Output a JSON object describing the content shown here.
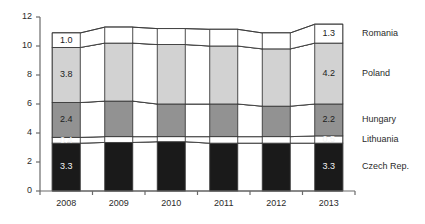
{
  "chart_data": {
    "type": "bar",
    "subtype": "stacked-bar-with-bands",
    "title": "",
    "subtitle": "",
    "xlabel": "",
    "ylabel": "",
    "categories": [
      "2008",
      "2009",
      "2010",
      "2011",
      "2012",
      "2013"
    ],
    "ylim": [
      0,
      12
    ],
    "yticks": [
      0,
      2,
      4,
      6,
      8,
      10,
      12
    ],
    "ytick_labels": [
      "0",
      "2",
      "4",
      "6",
      "8",
      "10",
      "12"
    ],
    "grid": false,
    "legend_position": "right",
    "series": [
      {
        "name": "Czech Rep.",
        "color": "#1a1a1a",
        "label_color": "#f2f2f2",
        "values": [
          3.3,
          3.35,
          3.4,
          3.3,
          3.3,
          3.3
        ],
        "labels": [
          "3.3",
          "",
          "",
          "",
          "",
          "3.3"
        ]
      },
      {
        "name": "Lithuania",
        "color": "#ffffff",
        "label_color": "#f2f2f2",
        "values": [
          0.4,
          0.4,
          0.35,
          0.45,
          0.45,
          0.5
        ],
        "labels": [
          "0.4",
          "",
          "",
          "",
          "",
          "0.5"
        ]
      },
      {
        "name": "Hungary",
        "color": "#929292",
        "label_color": "#1c1c1c",
        "values": [
          2.4,
          2.45,
          2.25,
          2.25,
          2.1,
          2.2
        ],
        "labels": [
          "2.4",
          "",
          "",
          "",
          "",
          "2.2"
        ]
      },
      {
        "name": "Poland",
        "color": "#d2d2d2",
        "label_color": "#1c1c1c",
        "values": [
          3.8,
          4.0,
          4.1,
          4.0,
          3.95,
          4.2
        ],
        "labels": [
          "3.8",
          "",
          "",
          "",
          "",
          "4.2"
        ]
      },
      {
        "name": "Romania",
        "color": "#ffffff",
        "label_color": "#1c1c1c",
        "values": [
          1.0,
          1.1,
          1.1,
          1.15,
          1.1,
          1.3
        ],
        "labels": [
          "1.0",
          "",
          "",
          "",
          "",
          "1.3"
        ]
      }
    ],
    "totals": [
      10.9,
      11.3,
      11.2,
      11.15,
      10.9,
      11.5
    ]
  },
  "legend": {
    "items": [
      {
        "label": "Romania"
      },
      {
        "label": "Poland"
      },
      {
        "label": "Hungary"
      },
      {
        "label": "Lithuania"
      },
      {
        "label": "Czech Rep."
      }
    ]
  }
}
